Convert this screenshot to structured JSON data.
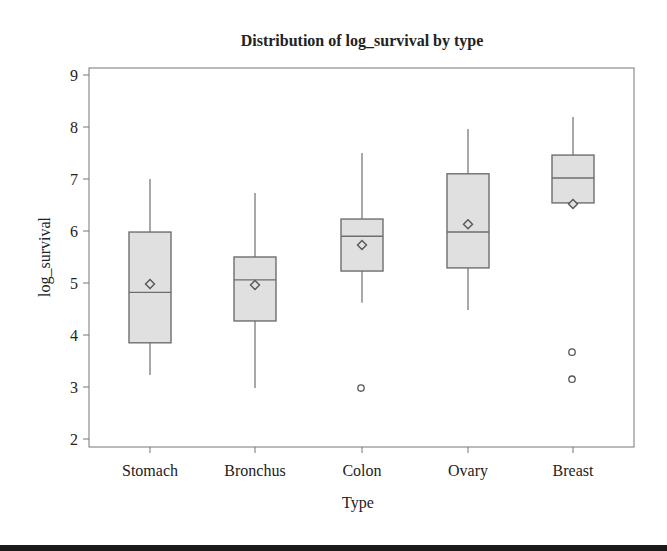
{
  "chart_data": {
    "type": "box",
    "title": "Distribution of log_survival by type",
    "xlabel": "Type",
    "ylabel": "log_survival",
    "ylim": [
      1.8,
      9.1
    ],
    "yticks": [
      2,
      3,
      4,
      5,
      6,
      7,
      8,
      9
    ],
    "grid": false,
    "legend": null,
    "categories": [
      "Stomach",
      "Bronchus",
      "Colon",
      "Ovary",
      "Breast"
    ],
    "boxes": [
      {
        "category": "Stomach",
        "whisker_low": 3.23,
        "q1": 3.85,
        "median": 4.82,
        "q3": 5.98,
        "whisker_high": 7.0,
        "mean": 4.98,
        "outliers": []
      },
      {
        "category": "Bronchus",
        "whisker_low": 2.98,
        "q1": 4.27,
        "median": 5.06,
        "q3": 5.5,
        "whisker_high": 6.73,
        "mean": 4.96,
        "outliers": []
      },
      {
        "category": "Colon",
        "whisker_low": 4.62,
        "q1": 5.23,
        "median": 5.9,
        "q3": 6.23,
        "whisker_high": 7.5,
        "mean": 5.73,
        "outliers": [
          2.98
        ]
      },
      {
        "category": "Ovary",
        "whisker_low": 4.48,
        "q1": 5.29,
        "median": 5.98,
        "q3": 7.1,
        "whisker_high": 7.96,
        "mean": 6.13,
        "outliers": []
      },
      {
        "category": "Breast",
        "whisker_low": 6.54,
        "q1": 6.54,
        "median": 7.02,
        "q3": 7.46,
        "whisker_high": 8.19,
        "mean": 6.52,
        "outliers": [
          3.67,
          3.15
        ]
      }
    ],
    "colors": {
      "box_fill": "#e0e0e0",
      "box_stroke": "#6e6e6e",
      "frame": "#777777",
      "text": "#222222"
    }
  }
}
